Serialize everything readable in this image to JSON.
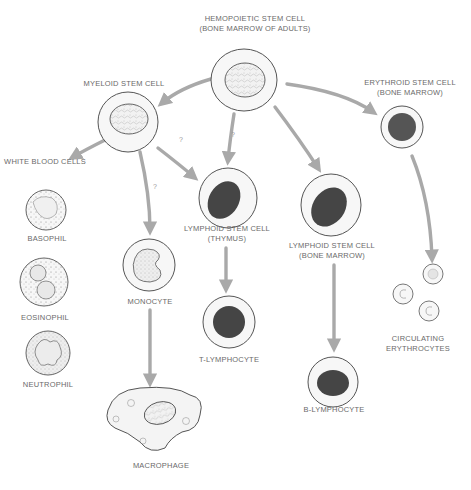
{
  "nodes": {
    "hemopoietic": {
      "line1": "HEMOPOIETIC STEM CELL",
      "line2": "(BONE MARROW OF ADULTS)"
    },
    "myeloid": {
      "line1": "MYELOID STEM CELL"
    },
    "erythroid": {
      "line1": "ERYTHROID STEM CELL",
      "line2": "(BONE MARROW)"
    },
    "white_blood_cells": {
      "line1": "WHITE BLOOD CELLS"
    },
    "basophil": {
      "line1": "BASOPHIL"
    },
    "eosinophil": {
      "line1": "EOSINOPHIL"
    },
    "neutrophil": {
      "line1": "NEUTROPHIL"
    },
    "monocyte": {
      "line1": "MONOCYTE"
    },
    "macrophage": {
      "line1": "MACROPHAGE"
    },
    "lymphoid_thymus": {
      "line1": "LYMPHOID STEM CELL",
      "line2": "(THYMUS)"
    },
    "t_lymphocyte": {
      "line1": "T-LYMPHOCYTE"
    },
    "lymphoid_bone_marrow": {
      "line1": "LYMPHOID STEM CELL",
      "line2": "(BONE MARROW)"
    },
    "b_lymphocyte": {
      "line1": "B-LYMPHOCYTE"
    },
    "erythrocytes": {
      "line1": "CIRCULATING",
      "line2": "ERYTHROCYTES"
    }
  },
  "uncertain_marks": {
    "mark": "?"
  },
  "edges": [
    {
      "from": "hemopoietic",
      "to": "myeloid"
    },
    {
      "from": "hemopoietic",
      "to": "lymphoid_thymus",
      "uncertain": true
    },
    {
      "from": "hemopoietic",
      "to": "lymphoid_bone_marrow"
    },
    {
      "from": "hemopoietic",
      "to": "erythroid"
    },
    {
      "from": "myeloid",
      "to": "white_blood_cells"
    },
    {
      "from": "myeloid",
      "to": "monocyte",
      "uncertain": true
    },
    {
      "from": "myeloid",
      "to": "lymphoid_thymus",
      "uncertain": true
    },
    {
      "from": "lymphoid_thymus",
      "to": "t_lymphocyte"
    },
    {
      "from": "lymphoid_bone_marrow",
      "to": "b_lymphocyte"
    },
    {
      "from": "monocyte",
      "to": "macrophage"
    },
    {
      "from": "erythroid",
      "to": "erythrocytes"
    }
  ],
  "colors": {
    "arrow": "#a9a9a9",
    "outline": "#555555",
    "nucleus_dark": "#444444",
    "cytoplasm": "#f4f4f4",
    "text": "#6a6a6a"
  }
}
